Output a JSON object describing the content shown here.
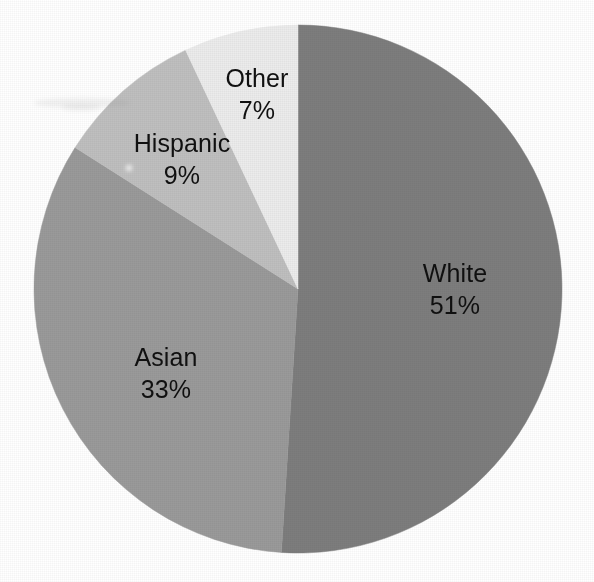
{
  "chart_data": {
    "type": "pie",
    "title": "",
    "subtitle": "",
    "xlabel": "",
    "ylabel": "",
    "legend_position": "none",
    "grid": false,
    "units": "percent",
    "total": 100,
    "start_angle_deg": 0,
    "direction": "clockwise",
    "categories": [
      "White",
      "Asian",
      "Hispanic",
      "Other"
    ],
    "values": [
      51,
      33,
      9,
      7
    ],
    "slices": [
      {
        "label": "White",
        "value": 51,
        "value_text": "51%",
        "color": "#7d7d7d",
        "start_deg": 0,
        "end_deg": 183.6,
        "label_x": 455,
        "label_y": 289
      },
      {
        "label": "Asian",
        "value": 33,
        "value_text": "33%",
        "color": "#9a9a9a",
        "start_deg": 183.6,
        "end_deg": 302.4,
        "label_x": 166,
        "label_y": 373
      },
      {
        "label": "Hispanic",
        "value": 9,
        "value_text": "9%",
        "color": "#bfbfbf",
        "start_deg": 302.4,
        "end_deg": 334.8,
        "label_x": 182,
        "label_y": 159
      },
      {
        "label": "Other",
        "value": 7,
        "value_text": "7%",
        "color": "#ececec",
        "start_deg": 334.8,
        "end_deg": 360,
        "label_x": 257,
        "label_y": 94
      }
    ],
    "geometry": {
      "center_x": 298,
      "center_y": 289,
      "radius": 264
    },
    "colors": {
      "background": "#ffffff",
      "text": "#101010",
      "white_slice": "#7d7d7d",
      "asian_slice": "#9a9a9a",
      "hispanic_slice": "#bfbfbf",
      "other_slice": "#ececec"
    }
  }
}
